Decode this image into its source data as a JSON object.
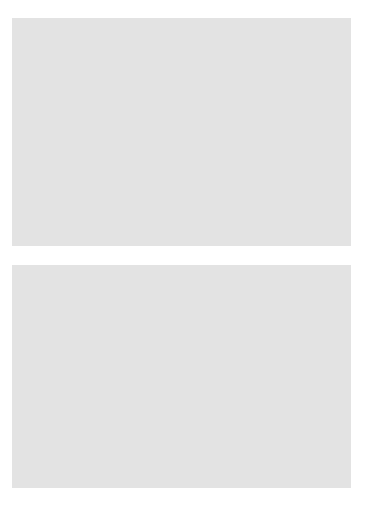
{
  "figure": {
    "background_color": "#ffffff",
    "panel_color": "#e3e3e3",
    "plot_area_color": "#ffffff",
    "point_color": "#2b2b2b",
    "axis_color": "#5a5a5a"
  },
  "chart_data": [
    {
      "id": "top-scatter",
      "type": "scatter",
      "title": "",
      "xlabel": "x",
      "ylabel": "y",
      "xlim": [
        60,
        145
      ],
      "ylim": [
        40,
        162
      ],
      "xticks": [
        60,
        80,
        100,
        120,
        140
      ],
      "yticks": [
        40,
        60,
        80,
        100,
        120,
        140,
        160
      ],
      "xtick_labels": [
        "60",
        "80",
        "100",
        "120",
        "140"
      ],
      "ytick_labels": [
        "40",
        "60",
        "80",
        "100",
        "120",
        "140",
        "160"
      ],
      "grid": false,
      "legend": "none",
      "points": [
        {
          "x": 64.5,
          "y": 51.5
        },
        {
          "x": 74.8,
          "y": 59.3
        },
        {
          "x": 75.3,
          "y": 82.8
        },
        {
          "x": 86.5,
          "y": 79.8
        },
        {
          "x": 86.8,
          "y": 104.3
        },
        {
          "x": 90.0,
          "y": 85.8
        },
        {
          "x": 90.3,
          "y": 104.5
        },
        {
          "x": 91.8,
          "y": 113.0
        },
        {
          "x": 92.8,
          "y": 128.3
        },
        {
          "x": 99.3,
          "y": 120.2
        },
        {
          "x": 100.8,
          "y": 100.7
        },
        {
          "x": 101.3,
          "y": 88.8
        },
        {
          "x": 102.8,
          "y": 128.3
        },
        {
          "x": 103.3,
          "y": 114.8
        },
        {
          "x": 105.8,
          "y": 86.5
        },
        {
          "x": 109.8,
          "y": 136.0
        },
        {
          "x": 111.3,
          "y": 116.2
        },
        {
          "x": 111.5,
          "y": 142.5
        },
        {
          "x": 111.8,
          "y": 95.2
        },
        {
          "x": 114.8,
          "y": 152.0
        },
        {
          "x": 115.3,
          "y": 125.2
        },
        {
          "x": 116.8,
          "y": 120.2
        },
        {
          "x": 124.8,
          "y": 110.0
        },
        {
          "x": 133.0,
          "y": 143.0
        },
        {
          "x": 136.8,
          "y": 114.2
        }
      ]
    },
    {
      "id": "bottom-scatter",
      "type": "scatter",
      "title": "",
      "xlabel": "x",
      "ylabel": "y",
      "xlim": [
        0,
        265
      ],
      "ylim": [
        0,
        252
      ],
      "xticks": [
        0,
        50,
        100,
        150,
        200,
        250
      ],
      "yticks": [
        0,
        50,
        100,
        150,
        200,
        250
      ],
      "xtick_labels": [
        "0",
        "50",
        "100",
        "150",
        "200",
        "250"
      ],
      "ytick_labels": [
        "0",
        "50",
        "100",
        "150",
        "200",
        "250"
      ],
      "grid": false,
      "legend": "none",
      "points": [
        {
          "x": 63.0,
          "y": 57.0
        },
        {
          "x": 74.0,
          "y": 66.0
        },
        {
          "x": 78.0,
          "y": 88.0
        },
        {
          "x": 84.0,
          "y": 81.0
        },
        {
          "x": 85.0,
          "y": 107.0
        },
        {
          "x": 88.0,
          "y": 106.0
        },
        {
          "x": 89.0,
          "y": 89.0
        },
        {
          "x": 91.0,
          "y": 129.0
        },
        {
          "x": 94.0,
          "y": 121.0
        },
        {
          "x": 96.0,
          "y": 125.0
        },
        {
          "x": 97.0,
          "y": 92.0
        },
        {
          "x": 98.0,
          "y": 106.0
        },
        {
          "x": 99.0,
          "y": 122.0
        },
        {
          "x": 100.0,
          "y": 117.0
        },
        {
          "x": 101.0,
          "y": 137.0
        },
        {
          "x": 102.0,
          "y": 100.0
        },
        {
          "x": 103.0,
          "y": 118.0
        },
        {
          "x": 104.0,
          "y": 89.0
        },
        {
          "x": 106.0,
          "y": 120.0
        },
        {
          "x": 107.0,
          "y": 143.0
        },
        {
          "x": 108.0,
          "y": 123.0
        },
        {
          "x": 109.0,
          "y": 100.0
        },
        {
          "x": 110.0,
          "y": 155.0
        },
        {
          "x": 111.0,
          "y": 147.0
        },
        {
          "x": 112.0,
          "y": 127.0
        },
        {
          "x": 120.0,
          "y": 114.0
        },
        {
          "x": 129.0,
          "y": 147.0
        },
        {
          "x": 133.0,
          "y": 117.0
        }
      ]
    }
  ]
}
